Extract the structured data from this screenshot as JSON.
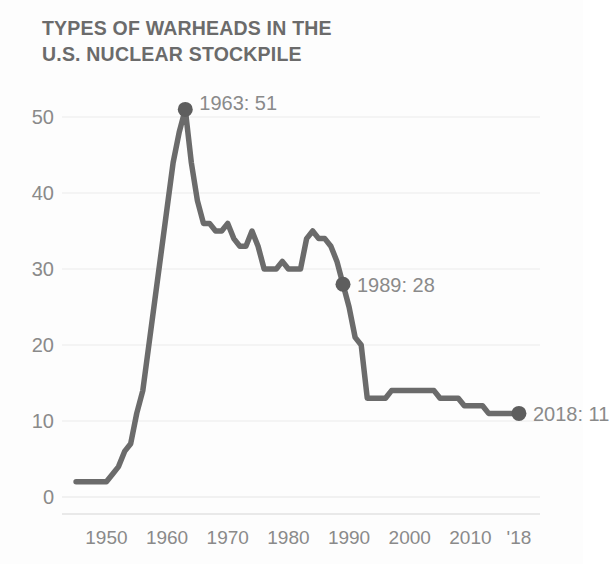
{
  "chart_data": {
    "type": "line",
    "title": "TYPES OF WARHEADS IN THE\nU.S. NUCLEAR STOCKPILE",
    "xlabel": "",
    "ylabel": "",
    "xlim": [
      1944,
      2019
    ],
    "ylim": [
      0,
      53
    ],
    "grid": true,
    "legend_position": "none",
    "line_color": "#6b6b6b",
    "marker_color": "#5e5e5e",
    "grid_color": "#ececec",
    "text_color": "#8a8a8a",
    "y_ticks": [
      0,
      10,
      20,
      30,
      40,
      50
    ],
    "y_tick_labels": [
      "0",
      "10",
      "20",
      "30",
      "40",
      "50"
    ],
    "x_ticks": [
      1950,
      1960,
      1970,
      1980,
      1990,
      2000,
      2010,
      2018
    ],
    "x_tick_labels": [
      "1950",
      "1960",
      "1970",
      "1980",
      "1990",
      "2000",
      "2010",
      "'18"
    ],
    "x": [
      1945,
      1946,
      1947,
      1948,
      1949,
      1950,
      1951,
      1952,
      1953,
      1954,
      1955,
      1956,
      1957,
      1958,
      1959,
      1960,
      1961,
      1962,
      1963,
      1964,
      1965,
      1966,
      1967,
      1968,
      1969,
      1970,
      1971,
      1972,
      1973,
      1974,
      1975,
      1976,
      1977,
      1978,
      1979,
      1980,
      1981,
      1982,
      1983,
      1984,
      1985,
      1986,
      1987,
      1988,
      1989,
      1990,
      1991,
      1992,
      1993,
      1994,
      1995,
      1996,
      1997,
      1998,
      1999,
      2000,
      2001,
      2002,
      2003,
      2004,
      2005,
      2006,
      2007,
      2008,
      2009,
      2010,
      2011,
      2012,
      2013,
      2014,
      2015,
      2016,
      2017,
      2018
    ],
    "values": [
      2,
      2,
      2,
      2,
      2,
      2,
      3,
      4,
      6,
      7,
      11,
      14,
      20,
      26,
      32,
      38,
      44,
      48,
      51,
      44,
      39,
      36,
      36,
      35,
      35,
      36,
      34,
      33,
      33,
      35,
      33,
      30,
      30,
      30,
      31,
      30,
      30,
      30,
      34,
      35,
      34,
      34,
      33,
      31,
      28,
      25,
      21,
      20,
      13,
      13,
      13,
      13,
      14,
      14,
      14,
      14,
      14,
      14,
      14,
      14,
      13,
      13,
      13,
      13,
      12,
      12,
      12,
      12,
      11,
      11,
      11,
      11,
      11,
      11
    ],
    "annotations": [
      {
        "label": "1963: 51",
        "year": 1963,
        "value": 51,
        "marker": true
      },
      {
        "label": "1989: 28",
        "year": 1989,
        "value": 28,
        "marker": true
      },
      {
        "label": "2018: 11",
        "year": 2018,
        "value": 11,
        "marker": true
      }
    ]
  }
}
